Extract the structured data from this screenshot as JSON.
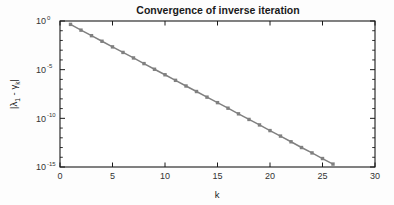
{
  "figure": {
    "background_color": "#fdfdfd",
    "plot_background_color": "#ffffff",
    "axis_color": "#1a1a1a"
  },
  "chart_data": {
    "type": "line",
    "title": "Convergence of inverse iteration",
    "xlabel": "k",
    "ylabel": "|λ1 - γk|",
    "ylabel_parts": {
      "open_bar": "|",
      "lambda": "λ",
      "lambda_sub": "1",
      "minus": " - ",
      "gamma": "γ",
      "gamma_sub": "k",
      "close_bar": "|"
    },
    "xscale": "linear",
    "yscale": "log",
    "xlim": [
      0,
      30
    ],
    "ylim": [
      1e-15,
      1
    ],
    "grid": false,
    "legend": null,
    "legend_position": "none",
    "series_color": "#808080",
    "marker": "square",
    "marker_color": "#808080",
    "xticks": [
      0,
      5,
      10,
      15,
      20,
      25,
      30
    ],
    "xtick_labels": [
      "0",
      "5",
      "10",
      "15",
      "20",
      "25",
      "30"
    ],
    "yticks": [
      1,
      1e-05,
      1e-10,
      1e-15
    ],
    "ytick_labels": [
      "10",
      "10",
      "10",
      "10"
    ],
    "ytick_exponents": [
      "0",
      "-5",
      "-10",
      "-15"
    ],
    "x": [
      1,
      2,
      3,
      4,
      5,
      6,
      7,
      8,
      9,
      10,
      11,
      12,
      13,
      14,
      15,
      16,
      17,
      18,
      19,
      20,
      21,
      22,
      23,
      24,
      25,
      26,
      27,
      28,
      29
    ],
    "y": [
      0.45,
      0.115,
      0.031,
      0.0083,
      0.0022,
      0.00059,
      0.00016,
      4.2e-05,
      1.1e-05,
      3e-06,
      8e-07,
      2.1e-07,
      5.7e-08,
      1.5e-08,
      4.1e-09,
      1.1e-09,
      2.9e-10,
      7.7e-11,
      2.1e-11,
      5.5e-12,
      1.5e-12,
      3.9e-13,
      1e-13,
      2.8e-14,
      7.4e-15,
      2e-15,
      5.2e-16,
      1.4e-16,
      3.7e-17
    ],
    "series": [
      {
        "name": "inverse iteration error",
        "values": [
          0.45,
          0.115,
          0.031,
          0.0083,
          0.0022,
          0.00059,
          0.00016,
          4.2e-05,
          1.1e-05,
          3e-06,
          8e-07,
          2.1e-07,
          5.7e-08,
          1.5e-08,
          4.1e-09,
          1.1e-09,
          2.9e-10,
          7.7e-11,
          2.1e-11,
          5.5e-12,
          1.5e-12,
          3.9e-13,
          1e-13,
          2.8e-14,
          7.4e-15,
          2e-15,
          5.2e-16,
          1.4e-16,
          3.7e-17
        ]
      }
    ]
  }
}
